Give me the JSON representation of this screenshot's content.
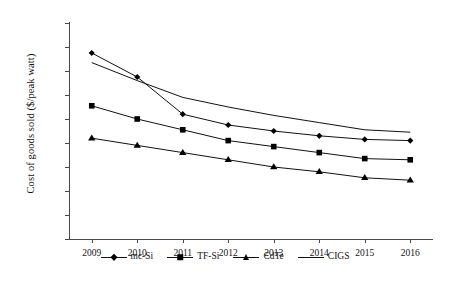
{
  "chart_data": {
    "type": "line",
    "title": "",
    "xlabel": "",
    "ylabel": "Cost of goods sold ($/peak watt)",
    "categories": [
      "2009",
      "2010",
      "2011",
      "2012",
      "2013",
      "2014",
      "2015",
      "2016"
    ],
    "x": [
      2009,
      2010,
      2011,
      2012,
      2013,
      2014,
      2015,
      2016
    ],
    "ylim": [
      0,
      1.8
    ],
    "yticks": [
      0,
      0.2,
      0.4,
      0.6,
      0.8,
      1.0,
      1.2,
      1.4,
      1.6,
      1.8
    ],
    "ytick_labels": [
      "$-",
      "$0.20",
      "$0.40",
      "$0.60",
      "$0.80",
      "$1.00",
      "$1.20",
      "$1.40",
      "$1.60",
      "$1.80"
    ],
    "grid": false,
    "legend_position": "bottom",
    "series": [
      {
        "name": "mc-Si",
        "marker": "diamond",
        "values": [
          1.55,
          1.35,
          1.04,
          0.95,
          0.9,
          0.86,
          0.83,
          0.82
        ]
      },
      {
        "name": "TF-Si",
        "marker": "square",
        "values": [
          1.11,
          1.0,
          0.91,
          0.82,
          0.77,
          0.72,
          0.67,
          0.66
        ]
      },
      {
        "name": "CdTe",
        "marker": "triangle",
        "values": [
          0.84,
          0.78,
          0.72,
          0.66,
          0.6,
          0.56,
          0.51,
          0.49
        ]
      },
      {
        "name": "CIGS",
        "marker": "none",
        "values": [
          1.47,
          1.32,
          1.18,
          1.1,
          1.03,
          0.97,
          0.91,
          0.89
        ]
      }
    ]
  },
  "legend": {
    "items": [
      {
        "label": "mc-Si"
      },
      {
        "label": "TF-Si"
      },
      {
        "label": "CdTe"
      },
      {
        "label": "CIGS"
      }
    ]
  }
}
